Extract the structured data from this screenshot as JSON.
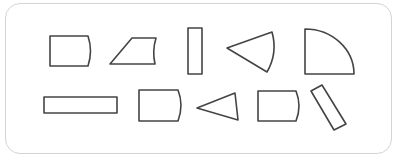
{
  "diagram": {
    "title": "",
    "stroke_color": "#444444",
    "card_border_color": "#d4d4d4",
    "shapes": [
      {
        "id": "shape-1",
        "type": "stored-data-rect",
        "row": 1
      },
      {
        "id": "shape-2",
        "type": "curved-trapezoid",
        "row": 1
      },
      {
        "id": "shape-3",
        "type": "tall-rectangle",
        "row": 1
      },
      {
        "id": "shape-4",
        "type": "circular-sector",
        "row": 1
      },
      {
        "id": "shape-5",
        "type": "quarter-circle",
        "row": 1
      },
      {
        "id": "shape-6",
        "type": "long-rectangle",
        "row": 2
      },
      {
        "id": "shape-7",
        "type": "stored-data-rect",
        "row": 2
      },
      {
        "id": "shape-8",
        "type": "triangle",
        "row": 2
      },
      {
        "id": "shape-9",
        "type": "stored-data-rect",
        "row": 2
      },
      {
        "id": "shape-10",
        "type": "tilted-rectangle",
        "row": 2
      }
    ]
  }
}
